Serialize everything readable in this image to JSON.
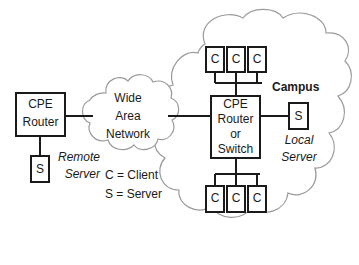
{
  "diagram": {
    "background_color": "#ffffff",
    "line_color": "#1a1a1a",
    "cloud_stroke_color": "#9a9a9a",
    "remote": {
      "router": {
        "line1": "CPE",
        "line2": "Router"
      },
      "server": {
        "glyph": "S",
        "caption_line1": "Remote",
        "caption_line2": "Server"
      }
    },
    "wan_cloud": {
      "line1": "Wide",
      "line2": "Area",
      "line3": "Network"
    },
    "legend": {
      "client": "C = Client",
      "server": "S = Server"
    },
    "campus": {
      "label": "Campus",
      "router": {
        "line1": "CPE",
        "line2": "Router",
        "line3": "or",
        "line4": "Switch"
      },
      "server": {
        "glyph": "S",
        "caption_line1": "Local",
        "caption_line2": "Server"
      },
      "top_clients": [
        {
          "glyph": "C"
        },
        {
          "glyph": "C"
        },
        {
          "glyph": "C"
        }
      ],
      "bottom_clients": [
        {
          "glyph": "C"
        },
        {
          "glyph": "C"
        },
        {
          "glyph": "C"
        }
      ]
    }
  }
}
